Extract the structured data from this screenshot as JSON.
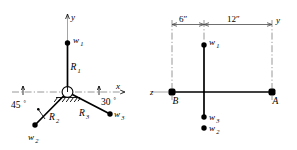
{
  "figure": {
    "ink_color": "#000000",
    "axis_color": "#9a9a9a",
    "dimension_color": "#4a4a4a",
    "background": "#ffffff"
  },
  "left_view": {
    "name": "front-elevation-view",
    "axes": {
      "x_label": "x",
      "y_label": "y"
    },
    "members": [
      {
        "id": "R1",
        "label": "R1",
        "label_main": "R",
        "label_sub": "1",
        "endpoint_load": "w1",
        "direction": "vertical-up"
      },
      {
        "id": "R2",
        "label": "R2",
        "label_main": "R",
        "label_sub": "2",
        "endpoint_load": "w2",
        "direction": "down-left",
        "angle_deg": 45,
        "angle_label": "45"
      },
      {
        "id": "R3",
        "label": "R3",
        "label_main": "R",
        "label_sub": "3",
        "endpoint_load": "w3",
        "direction": "down-right",
        "angle_deg": 30,
        "angle_label": "30"
      }
    ],
    "loads": [
      {
        "id": "w1",
        "label_main": "w",
        "label_sub": "1"
      },
      {
        "id": "w2",
        "label_main": "w",
        "label_sub": "2"
      },
      {
        "id": "w3",
        "label_main": "w",
        "label_sub": "3"
      }
    ],
    "angle_marks": [
      {
        "value": "45",
        "unit": "°",
        "measured_from": "x-axis-negative"
      },
      {
        "value": "30",
        "unit": "°",
        "measured_from": "x-axis-positive"
      }
    ],
    "support": {
      "type": "pinned-ball-support",
      "symbol": "circle-with-hatching"
    }
  },
  "right_view": {
    "name": "top-plan-view",
    "axes": {
      "z_label": "z",
      "y_label": "y"
    },
    "dimensions": [
      {
        "label": "6″",
        "text": "6″",
        "span": "B-to-center"
      },
      {
        "label": "12″",
        "text": "12″",
        "span": "center-to-A"
      }
    ],
    "supports": [
      {
        "id": "B",
        "label": "B",
        "position": "left"
      },
      {
        "id": "A",
        "label": "A",
        "position": "right"
      }
    ],
    "loads": [
      {
        "id": "w1",
        "label_main": "w",
        "label_sub": "1",
        "position": "above-axis"
      },
      {
        "id": "w3",
        "label_main": "w",
        "label_sub": "3",
        "position": "below-axis-upper"
      },
      {
        "id": "w2",
        "label_main": "w",
        "label_sub": "2",
        "position": "below-axis-lower"
      }
    ]
  }
}
